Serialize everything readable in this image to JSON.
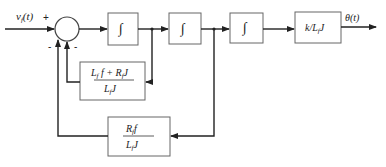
{
  "diagram": {
    "type": "block-diagram",
    "input": {
      "label": "v_f(t)",
      "sign": "+"
    },
    "summing_junction": {
      "feedback_signs": [
        "-",
        "-"
      ]
    },
    "blocks": [
      {
        "id": "integrator-1",
        "label": "∫"
      },
      {
        "id": "integrator-2",
        "label": "∫"
      },
      {
        "id": "integrator-3",
        "label": "∫"
      },
      {
        "id": "gain",
        "label": "k/L_fJ"
      }
    ],
    "feedback_blocks": [
      {
        "id": "inner-feedback",
        "numerator": "L_f f + R_f J",
        "denominator": "L_f J"
      },
      {
        "id": "outer-feedback",
        "numerator": "R_f f",
        "denominator": "L_f J"
      }
    ],
    "output": {
      "label": "θ(t)"
    }
  }
}
